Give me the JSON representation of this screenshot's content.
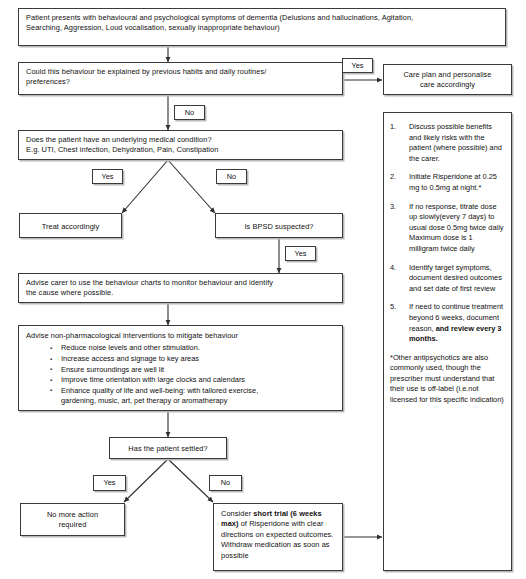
{
  "diagram": {
    "line_color": "#2f2f2f",
    "box_border_color": "#3a3a3a",
    "shadow_color": "#b9b9b9"
  },
  "nodes": {
    "presentation": {
      "line1": "Patient presents with behavioural and psychological symptoms of dementia (Delusions and hallucinations, Agitation,",
      "line2": "Searching, Aggression, Loud vocalisation, sexually inappropriate behaviour)"
    },
    "habits_question": {
      "line1": "Could this behaviour be explained by previous habits and daily routines/",
      "line2": "preferences?"
    },
    "care_plan": {
      "line1": "Care plan and personalise",
      "line2": "care accordingly"
    },
    "medical_condition": {
      "line1": "Does the patient have an underlying medical condition?",
      "line2": "E.g. UTI, Chest infection, Dehydration, Pain, Constipation"
    },
    "treat_accordingly": {
      "label": "Treat accordingly"
    },
    "bpsd_question": {
      "label": "Is BPSD suspected?"
    },
    "behaviour_charts": {
      "line1": "Advise carer to use the behaviour charts to monitor behaviour and identify",
      "line2": "the cause where possible."
    },
    "non_pharmacological": {
      "heading": "Advise non-pharmacological interventions to mitigate behaviour",
      "bullets": [
        "Reduce noise levels and other stimulation.",
        "Increase access and signage to key areas",
        "Ensure surroundings are well lit",
        "Improve time orientation with large clocks and calendars",
        "Enhance quality of life and well-being: with tailored exercise,"
      ],
      "bullet_5_continuation": "gardening, music, art, pet therapy or aromatherapy"
    },
    "settled_question": {
      "label": "Has the patient settled?"
    },
    "no_action": {
      "line1": "No more action",
      "line2": "required"
    },
    "short_trial": {
      "prefix": "Consider ",
      "bold": "short trial (6 weeks max)",
      "suffix": " of Risperidone with clear directions on expected outcomes. Withdraw medication as soon as possible"
    }
  },
  "edge_labels": {
    "habits_yes": "Yes",
    "habits_no": "No",
    "medical_yes": "Yes",
    "medical_no": "No",
    "bpsd_yes": "Yes",
    "settled_yes": "Yes",
    "settled_no": "No"
  },
  "side_panel": {
    "steps": [
      {
        "num": "1.",
        "text": "Discuss possible benefits and likely risks with the patient (where possible) and the carer."
      },
      {
        "num": "2.",
        "text": "Initiate Risperidone at 0.25 mg to 0.5mg at night.*"
      },
      {
        "num": "3.",
        "text": "If no response, titrate dose up slowly(every 7 days)  to usual dose 0.5mg  twice daily Maximum dose is 1 milligram twice daily"
      },
      {
        "num": "4.",
        "text": "Identify target symptoms, document desired outcomes and set date of first review"
      },
      {
        "num": "5.",
        "text_before_bold": "If need to continue treatment beyond 6 weeks, document reason, ",
        "bold": "and review every 3 months."
      }
    ],
    "footnote": "*Other antipsychotics are also commonly used, though the prescriber must understand that their use is off-label (i.e.not licensed for this specific indication)"
  }
}
